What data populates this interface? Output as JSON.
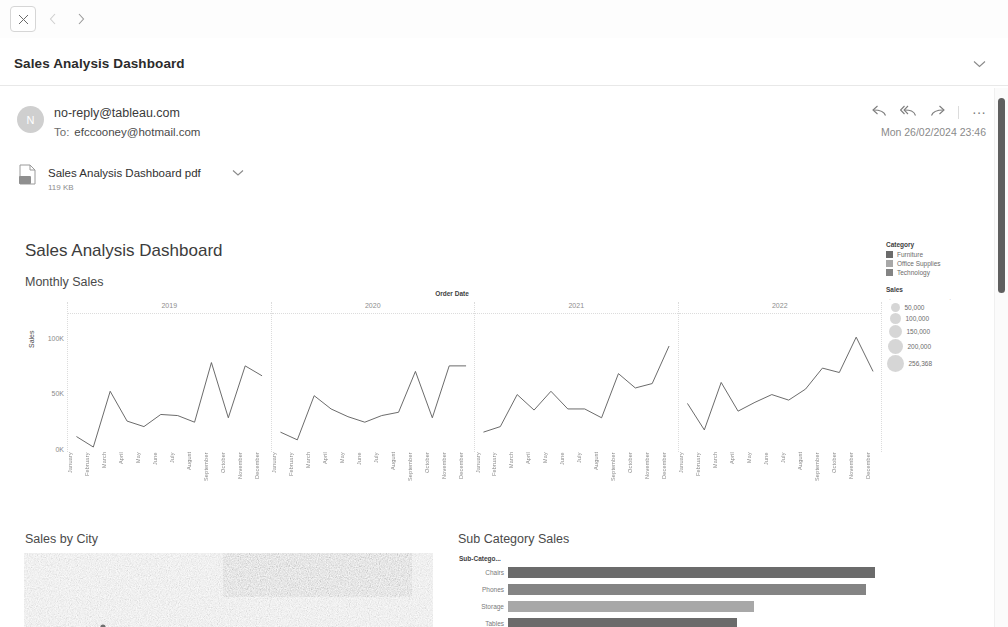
{
  "window": {
    "close_label": "✕",
    "back_label": "‹",
    "forward_label": "›"
  },
  "subject": {
    "title": "Sales Analysis Dashboard",
    "expand_label": "⌄"
  },
  "message": {
    "avatar_initial": "N",
    "from": "no-reply@tableau.com",
    "to_label": "To:",
    "to": "efccooney@hotmail.com",
    "timestamp": "Mon 26/02/2024 23:46",
    "actions": {
      "reply_label": "↩",
      "reply_all_label": "↩",
      "forward_label": "↪",
      "more_label": "···"
    }
  },
  "attachment": {
    "name": "Sales Analysis Dashboard pdf",
    "size": "119 KB",
    "chevron_label": "⌄"
  },
  "dashboard": {
    "title": "Sales Analysis Dashboard",
    "sheets": {
      "monthly_sales": "Monthly Sales",
      "sales_by_city": "Sales by City",
      "sub_category_sales": "Sub Category Sales"
    },
    "legend": {
      "category_title": "Category",
      "categories": [
        {
          "label": "Furniture",
          "color": "#6b6b6b"
        },
        {
          "label": "Office Supplies",
          "color": "#a8a8a8"
        },
        {
          "label": "Technology",
          "color": "#848484"
        }
      ],
      "sales_title": "Sales",
      "size_axis_min": "·",
      "size_axis_max": "·",
      "sizes": [
        {
          "label": "50,000",
          "d": 9
        },
        {
          "label": "100,000",
          "d": 11
        },
        {
          "label": "150,000",
          "d": 13
        },
        {
          "label": "200,000",
          "d": 15
        },
        {
          "label": "256,368",
          "d": 17
        }
      ]
    }
  },
  "chart_data": [
    {
      "type": "line",
      "title": "Monthly Sales",
      "xlabel": "Order Date",
      "ylabel": "Sales",
      "ylim": [
        0,
        125000
      ],
      "yticks": [
        "0K",
        "50K",
        "100K"
      ],
      "ytick_values": [
        0,
        50000,
        100000
      ],
      "grid": false,
      "categories": [
        "January",
        "February",
        "March",
        "April",
        "May",
        "June",
        "July",
        "August",
        "September",
        "October",
        "November",
        "December"
      ],
      "panels": [
        "2019",
        "2020",
        "2021",
        "2022"
      ],
      "series": [
        {
          "name": "2019",
          "values": [
            14000,
            4500,
            55000,
            28000,
            23000,
            34000,
            33000,
            27000,
            81000,
            31000,
            78000,
            69000
          ]
        },
        {
          "name": "2020",
          "values": [
            18000,
            11000,
            51000,
            39000,
            32000,
            27000,
            33000,
            36000,
            73000,
            31000,
            78000,
            78000
          ]
        },
        {
          "name": "2021",
          "values": [
            18000,
            23000,
            52000,
            38000,
            55000,
            39000,
            39000,
            31000,
            71000,
            58000,
            62000,
            96000
          ]
        },
        {
          "name": "2022",
          "values": [
            44000,
            20000,
            63000,
            37000,
            45000,
            52000,
            47000,
            57000,
            76000,
            72000,
            104000,
            73000
          ]
        }
      ]
    },
    {
      "type": "bar",
      "title": "Sub Category Sales",
      "axis_header": "Sub-Catego...",
      "orientation": "horizontal",
      "categories": [
        "Chairs",
        "Phones",
        "Storage",
        "Tables"
      ],
      "values": [
        328000,
        320000,
        220000,
        205000
      ],
      "xlim": [
        0,
        340000
      ],
      "colors": [
        "#6b6b6b",
        "#848484",
        "#a8a8a8",
        "#6b6b6b"
      ]
    },
    {
      "type": "map",
      "title": "Sales by City",
      "note": "symbol map of United States"
    }
  ]
}
